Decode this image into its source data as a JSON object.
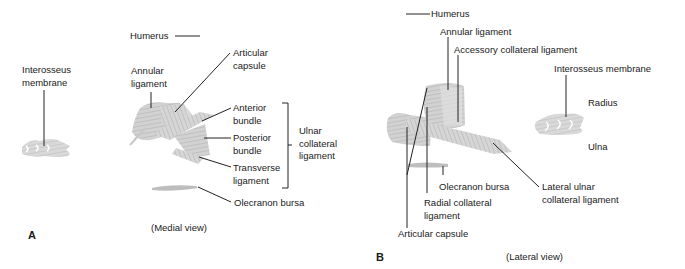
{
  "panel_a": {
    "letter": "A",
    "view": "(Medial view)",
    "labels": {
      "humerus": "Humerus",
      "interosseus_1": "Interosseus",
      "interosseus_2": "membrane",
      "annular_1": "Annular",
      "annular_2": "ligament",
      "articular_1": "Articular",
      "articular_2": "capsule",
      "anterior_1": "Anterior",
      "anterior_2": "bundle",
      "posterior_1": "Posterior",
      "posterior_2": "bundle",
      "transverse_1": "Transverse",
      "transverse_2": "ligament",
      "ulnar_1": "Ulnar",
      "ulnar_2": "collateral",
      "ulnar_3": "ligament",
      "olecranon": "Olecranon bursa"
    }
  },
  "panel_b": {
    "letter": "B",
    "view": "(Lateral view)",
    "labels": {
      "humerus": "Humerus",
      "annular": "Annular ligament",
      "accessory": "Accessory collateral ligament",
      "interosseus": "Interosseus membrane",
      "radius": "Radius",
      "ulna": "Ulna",
      "olecranon": "Olecranon bursa",
      "lateral_ulnar_1": "Lateral ulnar",
      "lateral_ulnar_2": "collateral ligament",
      "radial_1": "Radial collateral",
      "radial_2": "ligament",
      "articular": "Articular capsule"
    }
  },
  "colors": {
    "ligament_fill": "#c8c8c8",
    "ligament_stroke": "#a8a8a8",
    "leader_line": "#222222",
    "text": "#1a1a1a"
  }
}
